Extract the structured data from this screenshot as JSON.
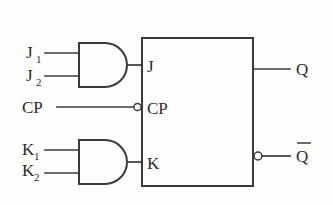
{
  "diagram": {
    "background_color": "#fefefe",
    "line_color": "#3a3a3a",
    "text_color": "#2b2b2b"
  },
  "inputs": {
    "j1": {
      "base": "J",
      "subscript": "1"
    },
    "j2": {
      "base": "J",
      "subscript": "2"
    },
    "cp": {
      "label": "CP"
    },
    "k1": {
      "base": "K",
      "subscript": "1"
    },
    "k2": {
      "base": "K",
      "subscript": "2"
    }
  },
  "gates": [
    {
      "name": "and-gate-j",
      "type": "AND",
      "inputs": [
        "J1",
        "J2"
      ],
      "output_to": "J"
    },
    {
      "name": "and-gate-k",
      "type": "AND",
      "inputs": [
        "K1",
        "K2"
      ],
      "output_to": "K"
    }
  ],
  "flipflop": {
    "type": "JK",
    "pins": {
      "j": "J",
      "cp": "CP",
      "k": "K",
      "q": "Q",
      "qbar": "Q"
    },
    "qbar_has_overbar": true,
    "cp_inverted": true,
    "qbar_inverted": true
  },
  "outputs": {
    "q": {
      "label": "Q"
    },
    "qbar": {
      "label": "Q",
      "overbar": true
    }
  }
}
